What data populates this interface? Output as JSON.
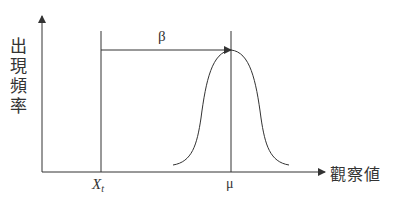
{
  "diagram": {
    "y_axis_label_chars": [
      "出",
      "現",
      "頻",
      "率"
    ],
    "y_axis_label": "出現頻率",
    "x_axis_label": "觀察値",
    "threshold_label": "X",
    "threshold_subscript": "t",
    "mean_label": "μ",
    "shift_label": "β",
    "colors": {
      "line": "#333333",
      "background": "#ffffff"
    }
  }
}
